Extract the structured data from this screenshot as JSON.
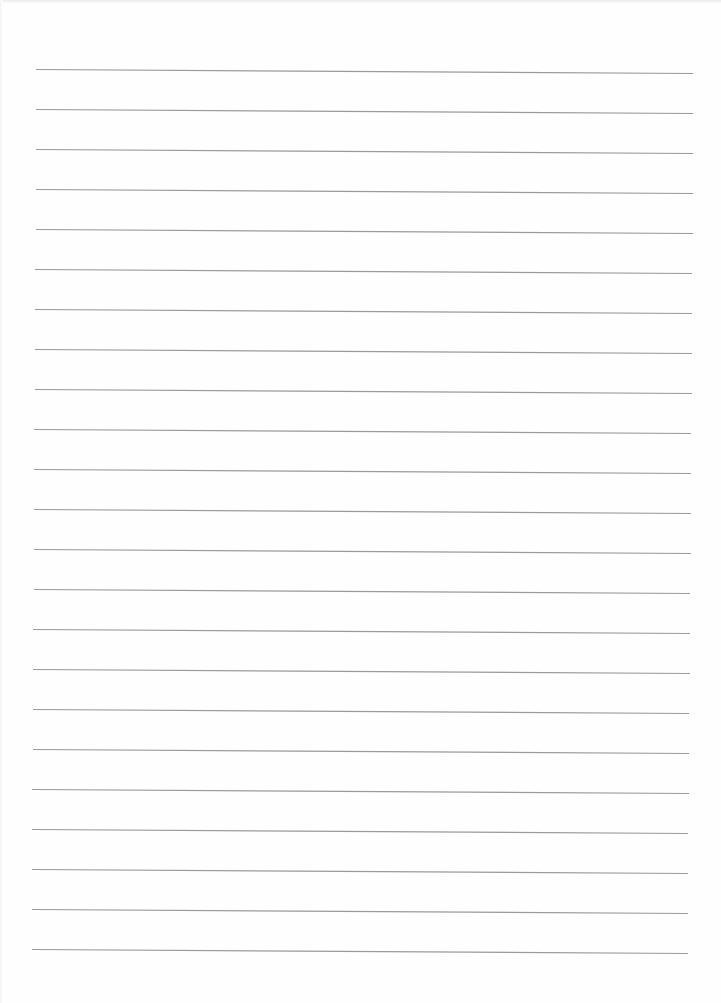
{
  "page": {
    "type": "lined-paper",
    "background_color": "#fefefe",
    "line_color": "#9a9a9a",
    "line_count": 23,
    "line_spacing_px": 40,
    "text_content": ""
  },
  "lines": [
    {
      "y_left": 69,
      "y_right": 73,
      "x_left": 36,
      "x_right": 693
    },
    {
      "y_left": 109,
      "y_right": 113,
      "x_left": 36,
      "x_right": 693
    },
    {
      "y_left": 149,
      "y_right": 153,
      "x_left": 36,
      "x_right": 693
    },
    {
      "y_left": 189,
      "y_right": 193,
      "x_left": 36,
      "x_right": 693
    },
    {
      "y_left": 229,
      "y_right": 233,
      "x_left": 36,
      "x_right": 693
    },
    {
      "y_left": 269,
      "y_right": 273,
      "x_left": 35,
      "x_right": 692
    },
    {
      "y_left": 309,
      "y_right": 313,
      "x_left": 35,
      "x_right": 692
    },
    {
      "y_left": 349,
      "y_right": 353,
      "x_left": 35,
      "x_right": 692
    },
    {
      "y_left": 389,
      "y_right": 393,
      "x_left": 35,
      "x_right": 692
    },
    {
      "y_left": 429,
      "y_right": 433,
      "x_left": 34,
      "x_right": 691
    },
    {
      "y_left": 469,
      "y_right": 473,
      "x_left": 34,
      "x_right": 691
    },
    {
      "y_left": 509,
      "y_right": 513,
      "x_left": 34,
      "x_right": 691
    },
    {
      "y_left": 549,
      "y_right": 553,
      "x_left": 34,
      "x_right": 691
    },
    {
      "y_left": 589,
      "y_right": 593,
      "x_left": 34,
      "x_right": 690
    },
    {
      "y_left": 629,
      "y_right": 633,
      "x_left": 33,
      "x_right": 690
    },
    {
      "y_left": 669,
      "y_right": 673,
      "x_left": 33,
      "x_right": 690
    },
    {
      "y_left": 709,
      "y_right": 713,
      "x_left": 33,
      "x_right": 689
    },
    {
      "y_left": 749,
      "y_right": 753,
      "x_left": 33,
      "x_right": 689
    },
    {
      "y_left": 789,
      "y_right": 793,
      "x_left": 32,
      "x_right": 689
    },
    {
      "y_left": 829,
      "y_right": 833,
      "x_left": 32,
      "x_right": 688
    },
    {
      "y_left": 869,
      "y_right": 873,
      "x_left": 32,
      "x_right": 688
    },
    {
      "y_left": 909,
      "y_right": 913,
      "x_left": 32,
      "x_right": 688
    },
    {
      "y_left": 949,
      "y_right": 953,
      "x_left": 32,
      "x_right": 688
    }
  ]
}
